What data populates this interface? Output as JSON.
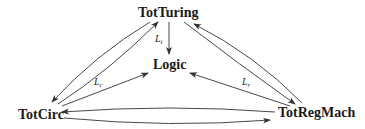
{
  "diagram": {
    "nodes": [
      {
        "id": "totturing",
        "label": "TotTuring"
      },
      {
        "id": "logic",
        "label": "Logic"
      },
      {
        "id": "totcirc",
        "label": "TotCirc"
      },
      {
        "id": "totregmach",
        "label": "TotRegMach"
      }
    ],
    "edges": [
      {
        "from": "TotTuring",
        "to": "Logic",
        "label_main": "L",
        "label_sub": "t"
      },
      {
        "from": "TotCirc",
        "to": "Logic",
        "label_main": "L",
        "label_sub": "c"
      },
      {
        "from": "TotRegMach",
        "to": "Logic",
        "label_main": "L",
        "label_sub": "r"
      },
      {
        "from": "TotTuring",
        "to": "TotCirc"
      },
      {
        "from": "TotCirc",
        "to": "TotTuring"
      },
      {
        "from": "TotTuring",
        "to": "TotRegMach"
      },
      {
        "from": "TotRegMach",
        "to": "TotTuring"
      },
      {
        "from": "TotRegMach",
        "to": "TotCirc"
      },
      {
        "from": "TotCirc",
        "to": "TotRegMach"
      }
    ],
    "colors": {
      "stroke": "#333333",
      "text": "#1a1a1a",
      "background": "#ffffff"
    }
  }
}
